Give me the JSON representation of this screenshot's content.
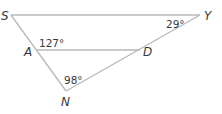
{
  "diagram": {
    "type": "triangle",
    "line_color": "#b8b8b8",
    "text_color": "#3a3a3a",
    "vertices": {
      "S": {
        "label": "S",
        "x": 11,
        "y": 15
      },
      "Y": {
        "label": "Y",
        "x": 200,
        "y": 15
      },
      "A": {
        "label": "A",
        "x": 37,
        "y": 50
      },
      "D": {
        "label": "D",
        "x": 140,
        "y": 50
      },
      "N": {
        "label": "N",
        "x": 66,
        "y": 91
      }
    },
    "segments": [
      {
        "from": "S",
        "to": "Y"
      },
      {
        "from": "S",
        "to": "N"
      },
      {
        "from": "Y",
        "to": "N"
      },
      {
        "from": "A",
        "to": "D"
      }
    ],
    "angles": {
      "Y": {
        "label": "29°",
        "vertex": "Y"
      },
      "A": {
        "label": "127°",
        "vertex": "A"
      },
      "N": {
        "label": "98°",
        "vertex": "N"
      }
    }
  }
}
